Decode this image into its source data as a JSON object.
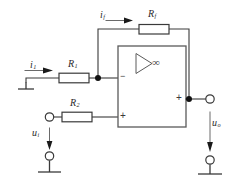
{
  "diagram": {
    "colors": {
      "wire": "#3a3a3a",
      "background": "#ffffff",
      "node": "#111111",
      "amp_outline": "#5a5a5a"
    },
    "labels": {
      "current_input": "i",
      "current_input_sub": "1",
      "current_feedback": "i",
      "current_feedback_sub": "f",
      "resistor_input": "R",
      "resistor_input_sub": "1",
      "resistor_feedback": "R",
      "resistor_feedback_sub": "f",
      "resistor_bias": "R",
      "resistor_bias_sub": "2",
      "voltage_input": "u",
      "voltage_input_sub": "i",
      "voltage_output": "u",
      "voltage_output_sub": "o"
    },
    "opamp": {
      "gain_symbol": "∞",
      "inverting_sign": "−",
      "noninverting_sign": "+",
      "output_sign": "+"
    },
    "components": [
      {
        "name": "resistor-rf",
        "label": "R",
        "sub": "f",
        "orientation": "horizontal"
      },
      {
        "name": "resistor-r1",
        "label": "R",
        "sub": "1",
        "orientation": "horizontal"
      },
      {
        "name": "resistor-r2",
        "label": "R",
        "sub": "2",
        "orientation": "horizontal"
      }
    ],
    "terminals": [
      {
        "name": "input-terminal-top",
        "type": "open-circle"
      },
      {
        "name": "input-terminal-bottom",
        "type": "open-circle"
      },
      {
        "name": "output-terminal-top",
        "type": "open-circle"
      },
      {
        "name": "output-terminal-bottom",
        "type": "open-circle"
      }
    ],
    "grounds": [
      {
        "name": "ground-left"
      },
      {
        "name": "ground-input"
      },
      {
        "name": "ground-output"
      }
    ]
  }
}
